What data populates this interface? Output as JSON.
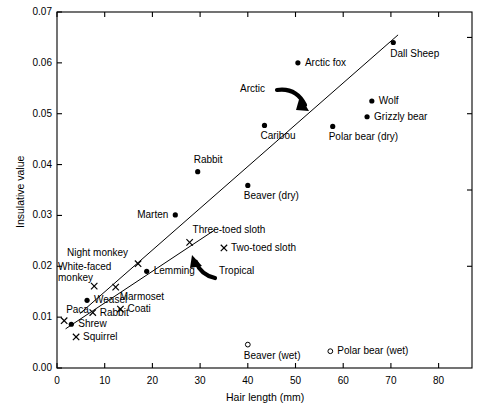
{
  "chart_data": {
    "type": "scatter",
    "title": "",
    "xlabel": "Hair length (mm)",
    "ylabel": "Insulative value",
    "xlim": [
      0,
      87
    ],
    "ylim": [
      0,
      0.07
    ],
    "xticks": [
      "0",
      "10",
      "20",
      "30",
      "40",
      "50",
      "60",
      "70",
      "80"
    ],
    "xtick_values": [
      0,
      10,
      20,
      30,
      40,
      50,
      60,
      70,
      80
    ],
    "yticks": [
      "0.00",
      "0.01",
      "0.02",
      "0.03",
      "0.04",
      "0.05",
      "0.06",
      "0.07"
    ],
    "ytick_values": [
      0,
      0.01,
      0.02,
      0.03,
      0.04,
      0.05,
      0.06,
      0.07
    ],
    "grid": false,
    "legend": "none",
    "marker_types": {
      "filled-circle": "Arctic species (filled dot)",
      "cross": "Tropical species (x)",
      "open-circle": "Wet pelt (open dot)"
    },
    "points": [
      {
        "label": "Dall Sheep",
        "x": 70.5,
        "y": 0.064,
        "marker": "filled-circle",
        "label_pos": "below-right"
      },
      {
        "label": "Arctic fox",
        "x": 50.5,
        "y": 0.06,
        "marker": "filled-circle",
        "label_pos": "right"
      },
      {
        "label": "Wolf",
        "x": 66.0,
        "y": 0.0525,
        "marker": "filled-circle",
        "label_pos": "right"
      },
      {
        "label": "Grizzly bear",
        "x": 65.0,
        "y": 0.0494,
        "marker": "filled-circle",
        "label_pos": "right"
      },
      {
        "label": "Caribou",
        "x": 43.5,
        "y": 0.0477,
        "marker": "filled-circle",
        "label_pos": "below"
      },
      {
        "label": "Polar bear (dry)",
        "x": 57.8,
        "y": 0.0475,
        "marker": "filled-circle",
        "label_pos": "below"
      },
      {
        "label": "Rabbit",
        "x": 29.5,
        "y": 0.0386,
        "marker": "filled-circle",
        "label_pos": "above"
      },
      {
        "label": "Beaver (dry)",
        "x": 40.0,
        "y": 0.0359,
        "marker": "filled-circle",
        "label_pos": "below"
      },
      {
        "label": "Marten",
        "x": 24.8,
        "y": 0.0301,
        "marker": "filled-circle",
        "label_pos": "left"
      },
      {
        "label": "Three-toed sloth",
        "x": 27.8,
        "y": 0.0247,
        "marker": "cross",
        "label_pos": "above-right"
      },
      {
        "label": "Two-toed sloth",
        "x": 35.0,
        "y": 0.0236,
        "marker": "cross",
        "label_pos": "right"
      },
      {
        "label": "Night monkey",
        "x": 17.0,
        "y": 0.0205,
        "marker": "cross",
        "label_pos": "above-left"
      },
      {
        "label": "Lemming",
        "x": 18.8,
        "y": 0.019,
        "marker": "filled-circle",
        "label_pos": "right"
      },
      {
        "label": "White-faced monkey",
        "x": 7.8,
        "y": 0.0161,
        "marker": "cross",
        "label_pos": "left"
      },
      {
        "label": "Marmoset",
        "x": 12.3,
        "y": 0.0159,
        "marker": "cross",
        "label_pos": "below-right"
      },
      {
        "label": "Weasel",
        "x": 6.3,
        "y": 0.0133,
        "marker": "filled-circle",
        "label_pos": "right"
      },
      {
        "label": "Coati",
        "x": 13.3,
        "y": 0.0116,
        "marker": "cross",
        "label_pos": "right"
      },
      {
        "label": "Rabbit",
        "x": 7.5,
        "y": 0.0109,
        "marker": "cross",
        "label_pos": "right"
      },
      {
        "label": "Paca",
        "x": 1.5,
        "y": 0.0093,
        "marker": "cross",
        "label_pos": "above-right"
      },
      {
        "label": "Shrew",
        "x": 3.0,
        "y": 0.0086,
        "marker": "filled-circle",
        "label_pos": "right"
      },
      {
        "label": "Squirrel",
        "x": 4.0,
        "y": 0.0061,
        "marker": "cross",
        "label_pos": "right"
      },
      {
        "label": "Beaver (wet)",
        "x": 40.0,
        "y": 0.0046,
        "marker": "open-circle",
        "label_pos": "below"
      },
      {
        "label": "Polar bear (wet)",
        "x": 57.3,
        "y": 0.0033,
        "marker": "open-circle",
        "label_pos": "right"
      }
    ],
    "trend_lines": [
      {
        "name": "Arctic",
        "x_start": 4.8,
        "y_start": 0.0107,
        "x_end": 71.5,
        "y_end": 0.0655
      },
      {
        "name": "Tropical",
        "x_start": 1.8,
        "y_start": 0.0077,
        "x_end": 33.0,
        "y_end": 0.0271
      }
    ],
    "annotations": [
      {
        "label": "Arctic",
        "target_line": "Arctic",
        "arrow": "curved-down-right"
      },
      {
        "label": "Tropical",
        "target_line": "Tropical",
        "arrow": "curved-up-left"
      }
    ]
  }
}
